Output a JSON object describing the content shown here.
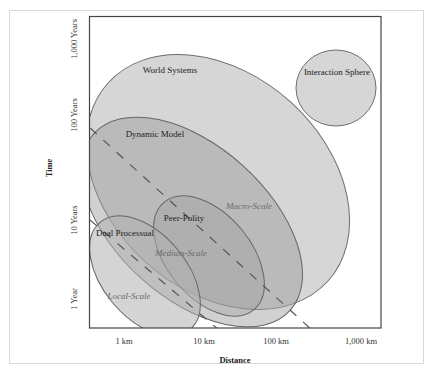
{
  "figure": {
    "type": "scale-diagram",
    "x_axis": {
      "label": "Distance",
      "ticks": [
        "1 km",
        "10 km",
        "100 km",
        "1,000 km"
      ]
    },
    "y_axis": {
      "label": "Time",
      "ticks": [
        "1 Year",
        "10 Years",
        "100 Years",
        "1,000 Years"
      ]
    },
    "regions": [
      {
        "name": "World Systems",
        "label": "World Systems"
      },
      {
        "name": "Interaction Sphere",
        "label": "Interaction Sphere"
      },
      {
        "name": "Dynamic Model",
        "label": "Dynamic Model"
      },
      {
        "name": "Peer-Polity",
        "label": "Peer-Polity"
      },
      {
        "name": "Dual Processual",
        "label": "Dual Processual"
      }
    ],
    "scale_labels": {
      "macro": "Macro-Scale",
      "medium": "Medium-Scale",
      "local": "Local-Scale"
    },
    "colors": {
      "frame": "#d9d9d9",
      "axis": "#444444",
      "region_fill": "#c8c8c8",
      "region_stroke": "#6e6e6e",
      "dash": "#555555",
      "italic_label": "#6a6a6a"
    }
  }
}
